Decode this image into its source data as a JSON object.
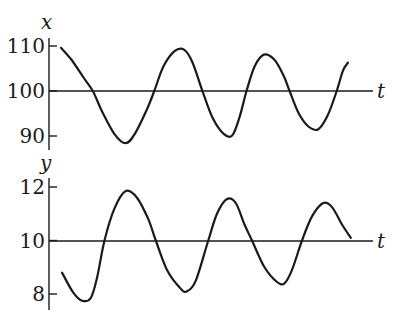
{
  "chart_data": [
    {
      "type": "line",
      "title": "",
      "ylabel": "x",
      "xlabel": "t",
      "ylim": [
        87,
        112
      ],
      "yticks": [
        90,
        100,
        110
      ],
      "ytick_labels": [
        "90",
        "100",
        "110"
      ],
      "baseline": 100,
      "grid": false,
      "legend": "none",
      "series": [
        {
          "name": "x",
          "points": [
            [
              0.0,
              109.6
            ],
            [
              0.05,
              107.0
            ],
            [
              0.11,
              103.0
            ],
            [
              0.155,
              100.0
            ],
            [
              0.2,
              95.5
            ],
            [
              0.26,
              90.5
            ],
            [
              0.315,
              88.4
            ],
            [
              0.36,
              90.5
            ],
            [
              0.42,
              96.0
            ],
            [
              0.455,
              100.0
            ],
            [
              0.5,
              105.5
            ],
            [
              0.555,
              108.9
            ],
            [
              0.6,
              109.2
            ],
            [
              0.64,
              106.5
            ],
            [
              0.69,
              100.0
            ],
            [
              0.74,
              94.0
            ],
            [
              0.795,
              90.4
            ],
            [
              0.835,
              90.1
            ],
            [
              0.87,
              94.0
            ],
            [
              0.905,
              100.0
            ],
            [
              0.945,
              105.5
            ],
            [
              0.99,
              108.1
            ],
            [
              1.04,
              107.0
            ],
            [
              1.085,
              103.5
            ],
            [
              1.115,
              100.0
            ],
            [
              1.16,
              95.0
            ],
            [
              1.21,
              92.0
            ],
            [
              1.255,
              91.5
            ],
            [
              1.3,
              94.5
            ],
            [
              1.345,
              100.0
            ],
            [
              1.375,
              104.5
            ],
            [
              1.4,
              106.3
            ]
          ]
        }
      ]
    },
    {
      "type": "line",
      "title": "",
      "ylabel": "y",
      "xlabel": "t",
      "ylim": [
        7.3,
        12.6
      ],
      "yticks": [
        8,
        10,
        12
      ],
      "ytick_labels": [
        "8",
        "10",
        "12"
      ],
      "baseline": 10,
      "grid": false,
      "legend": "none",
      "series": [
        {
          "name": "y",
          "points": [
            [
              0.0,
              8.8
            ],
            [
              0.045,
              8.05
            ],
            [
              0.08,
              7.75
            ],
            [
              0.115,
              7.85
            ],
            [
              0.14,
              8.6
            ],
            [
              0.17,
              10.0
            ],
            [
              0.21,
              11.2
            ],
            [
              0.255,
              11.85
            ],
            [
              0.3,
              11.6
            ],
            [
              0.345,
              10.8
            ],
            [
              0.375,
              10.0
            ],
            [
              0.42,
              8.9
            ],
            [
              0.475,
              8.2
            ],
            [
              0.5,
              8.1
            ],
            [
              0.535,
              8.5
            ],
            [
              0.585,
              10.0
            ],
            [
              0.62,
              11.0
            ],
            [
              0.66,
              11.55
            ],
            [
              0.695,
              11.4
            ],
            [
              0.73,
              10.6
            ],
            [
              0.76,
              10.0
            ],
            [
              0.81,
              9.0
            ],
            [
              0.86,
              8.45
            ],
            [
              0.89,
              8.4
            ],
            [
              0.92,
              8.9
            ],
            [
              0.96,
              10.0
            ],
            [
              1.0,
              10.9
            ],
            [
              1.045,
              11.4
            ],
            [
              1.08,
              11.25
            ],
            [
              1.12,
              10.6
            ],
            [
              1.155,
              10.1
            ]
          ]
        }
      ]
    }
  ],
  "labels": {
    "top_yvar": "x",
    "top_xvar": "t",
    "bottom_yvar": "y",
    "bottom_xvar": "t"
  }
}
